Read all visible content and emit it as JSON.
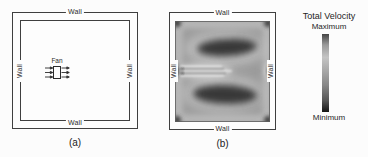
{
  "panel_a": {
    "caption": "(a)",
    "fan_label": "Fan",
    "walls": {
      "top": "Wall",
      "bottom": "Wall",
      "left": "Wall",
      "right": "Wall"
    }
  },
  "panel_b": {
    "caption": "(b)",
    "walls": {
      "top": "Wall",
      "bottom": "Wall",
      "left": "Wall",
      "right": "Wall"
    }
  },
  "legend": {
    "title": "Total Velocity",
    "max_label": "Maximum",
    "min_label": "Minimum",
    "colorbar_stops": [
      "#454545 0%",
      "#9a9a9a 14%",
      "#c4c4c4 30%",
      "#a6a6a6 48%",
      "#868686 66%",
      "#565656 85%",
      "#141414 100%"
    ]
  },
  "colors": {
    "line": "#3f3f3f",
    "text": "#2b2b2b",
    "contour_background": "#9a9a9a",
    "contour_dark_core": "#383838",
    "contour_light_halo": "#c6c6c6"
  }
}
